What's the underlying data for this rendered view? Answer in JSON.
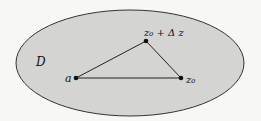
{
  "diagram": {
    "region_label": "D",
    "points": {
      "a": {
        "label": "a",
        "x": 76,
        "y": 78
      },
      "z0": {
        "label": "z₀",
        "x": 181,
        "y": 78
      },
      "z0_dz": {
        "label": "z₀ + Δ z",
        "x": 146,
        "y": 41
      }
    },
    "colors": {
      "region_fill": "#d4d4d2",
      "stroke": "#222222"
    }
  }
}
